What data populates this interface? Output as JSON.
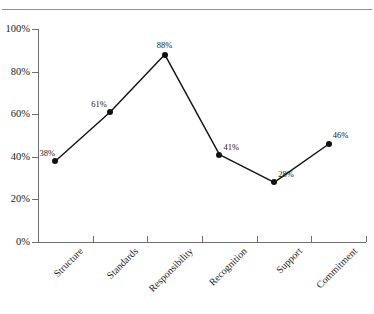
{
  "header": {
    "clipped_title_fragment": "·",
    "rule_color": "#8e8e8e"
  },
  "chart_data": {
    "type": "line",
    "title": "",
    "subtitle": "",
    "xlabel": "",
    "ylabel": "",
    "categories": [
      "Structure",
      "Standards",
      "Responsibility",
      "Recognition",
      "Support",
      "Commitment"
    ],
    "values": [
      38,
      61,
      88,
      41,
      28,
      46
    ],
    "point_labels": [
      "38%",
      "61%",
      "88%",
      "41%",
      "28%",
      "46%"
    ],
    "ylim": [
      0,
      100
    ],
    "yticks": [
      0,
      20,
      40,
      60,
      80,
      100
    ],
    "ytick_labels": [
      "0%",
      "20%",
      "40%",
      "60%",
      "80%",
      "100%"
    ],
    "grid": false,
    "legend": "none",
    "series_color": "#111111",
    "marker": "filled-circle",
    "axis_color": "#6f6f6f",
    "units": "percent"
  }
}
